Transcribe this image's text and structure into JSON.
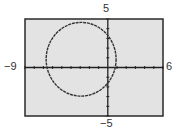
{
  "chart_data": {
    "type": "line",
    "title": "",
    "xlabel": "",
    "ylabel": "",
    "xlim": [
      -9,
      6
    ],
    "ylim": [
      -5,
      5
    ],
    "xscale": 1,
    "yscale": 1,
    "grid": false,
    "tick_labels": {
      "xmin": "−9",
      "xmax": "6",
      "ymin": "−5",
      "ymax": "5"
    },
    "series": [
      {
        "name": "circle",
        "shape": "circle",
        "center": [
          -2.9,
          0.85
        ],
        "radius": 3.8
      }
    ]
  },
  "colors": {
    "screen_bg": "#e3e3e3",
    "frame": "#2a2a2a",
    "curve": "#333333",
    "axis": "#222222"
  }
}
